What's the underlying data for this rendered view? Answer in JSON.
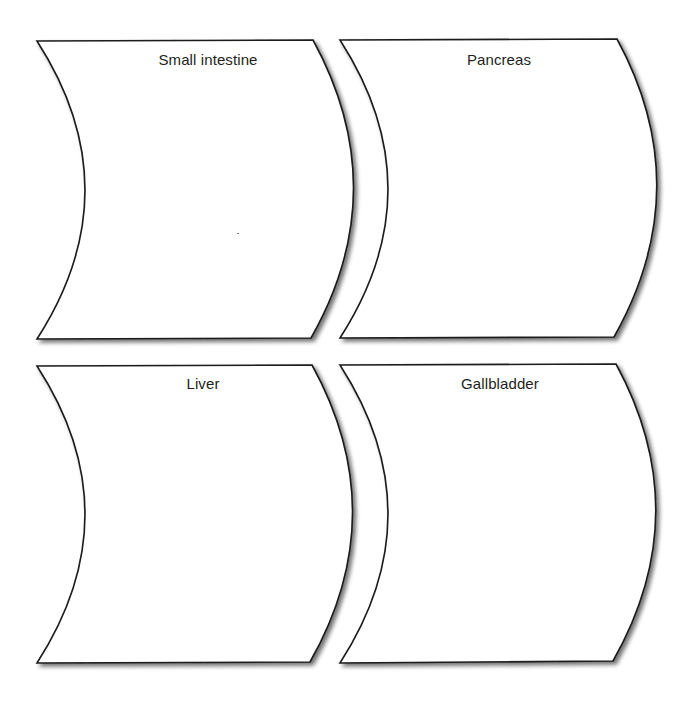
{
  "diagram": {
    "type": "graphic-organizer",
    "style": {
      "stroke_color": "#1a1a1a",
      "fill_color": "#ffffff",
      "label_color": "#231f20",
      "background": "#ffffff"
    },
    "cards": [
      {
        "id": "small-intestine",
        "label": "Small intestine",
        "position": "top-left",
        "content": ""
      },
      {
        "id": "pancreas",
        "label": "Pancreas",
        "position": "top-right",
        "content": ""
      },
      {
        "id": "liver",
        "label": "Liver",
        "position": "bottom-left",
        "content": ""
      },
      {
        "id": "gallbladder",
        "label": "Gallbladder",
        "position": "bottom-right",
        "content": ""
      }
    ]
  }
}
